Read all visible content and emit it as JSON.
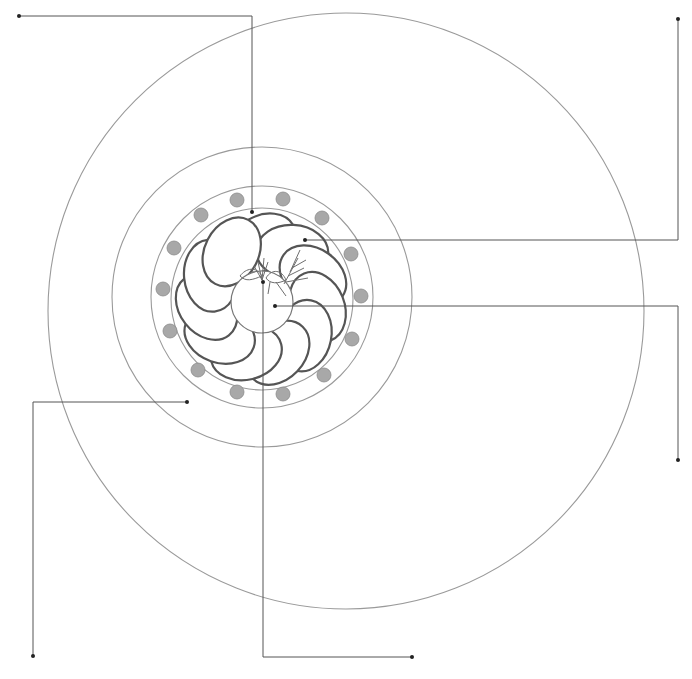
{
  "colors": {
    "background": "#ffffff",
    "plate_line": "#9a9a9a",
    "leader_line": "#555555",
    "petal_stroke": "#555555",
    "dot_fill": "#a8a8a8",
    "garnish": "#6e6e6e"
  },
  "plate": {
    "center_outer": [
      346,
      311
    ],
    "outer_radius": 298,
    "center": [
      262,
      297
    ],
    "charger_radius": 150,
    "rim_radius": 111,
    "well_radius": 91
  },
  "rim_dots": {
    "radius": 7,
    "positions": [
      [
        237,
        200
      ],
      [
        283,
        199
      ],
      [
        322,
        218
      ],
      [
        351,
        254
      ],
      [
        361,
        296
      ],
      [
        352,
        339
      ],
      [
        324,
        375
      ],
      [
        283,
        394
      ],
      [
        237,
        392
      ],
      [
        198,
        370
      ],
      [
        170,
        331
      ],
      [
        163,
        289
      ],
      [
        174,
        248
      ],
      [
        201,
        215
      ]
    ]
  },
  "slices": {
    "count": 11,
    "ring_radius": 56,
    "slice_rx": 36,
    "slice_ry": 27
  },
  "tomato": {
    "center": [
      262,
      302
    ],
    "radius": 31
  },
  "leaders": [
    {
      "points": [
        [
          19,
          16
        ],
        [
          252,
          16
        ],
        [
          252,
          212
        ]
      ]
    },
    {
      "points": [
        [
          678,
          19
        ],
        [
          678,
          240
        ],
        [
          305,
          240
        ]
      ]
    },
    {
      "points": [
        [
          678,
          460
        ],
        [
          678,
          306
        ],
        [
          275,
          306
        ]
      ]
    },
    {
      "points": [
        [
          33,
          656
        ],
        [
          33,
          402
        ],
        [
          187,
          402
        ]
      ]
    },
    {
      "points": [
        [
          412,
          657
        ],
        [
          263,
          657
        ],
        [
          263,
          282
        ]
      ]
    }
  ]
}
